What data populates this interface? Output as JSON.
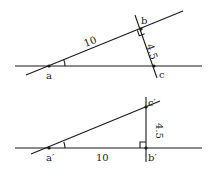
{
  "diagram": {
    "top": {
      "labels": {
        "a": "a",
        "b": "b",
        "c": "c",
        "hyp": "10",
        "leg": "4.5"
      },
      "right_angle_at": "b"
    },
    "bottom": {
      "labels": {
        "a": "a′",
        "b": "b′",
        "c": "c′",
        "base": "10",
        "leg": "4.5"
      },
      "right_angle_at": "b′"
    }
  }
}
